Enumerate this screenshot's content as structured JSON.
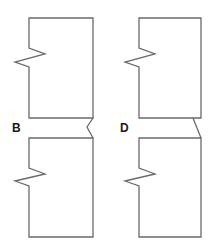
{
  "diagram": {
    "title": "",
    "stroke_color": "#6a6a6a",
    "label_color": "#1a1a1a",
    "background": "#ffffff",
    "panels": [
      {
        "id": "B",
        "label": "B",
        "label_position": {
          "x": 12,
          "y": 122
        },
        "connector_type": "zigzag",
        "top_piece": {
          "path": "M 29 18 L 93 18 L 93 118 L 29 118 L 29 67 L 15 62 L 45 54 L 29 48 Z"
        },
        "bottom_piece": {
          "path": "M 29 138 L 93 138 L 93 237 L 29 237 L 29 186 L 15 181 L 45 174 L 29 168 Z"
        },
        "connector": {
          "path": "M 93 118 L 87 127 L 93 138"
        }
      },
      {
        "id": "D",
        "label": "D",
        "label_position": {
          "x": 120,
          "y": 122
        },
        "connector_type": "diagonal",
        "top_piece": {
          "path": "M 139 18 L 201 18 L 201 118 L 139 118 L 139 67 L 125 62 L 155 54 L 139 48 Z"
        },
        "bottom_piece": {
          "path": "M 139 138 L 201 138 L 201 237 L 139 237 L 139 186 L 125 181 L 155 174 L 139 168 Z"
        },
        "connector": {
          "path": "M 193 118 L 201 138"
        }
      }
    ]
  }
}
